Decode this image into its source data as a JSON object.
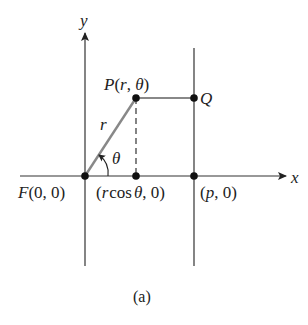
{
  "figure": {
    "caption": "(a)",
    "axes": {
      "x_label": "x",
      "y_label": "y"
    },
    "points": {
      "F": {
        "label_name": "F",
        "label_coords": "(0, 0)"
      },
      "P": {
        "label_name": "P",
        "label_coords": "(r, θ)"
      },
      "Q": {
        "label": "Q"
      },
      "foot": {
        "label_prefix": "(",
        "label_r": "r",
        "label_cos": "cos",
        "label_theta": "θ",
        "label_suffix": ", 0)"
      },
      "directrix_point": {
        "label_open": "(",
        "label_p": "p",
        "label_close": ", 0)"
      }
    },
    "segment_labels": {
      "radius": "r",
      "angle": "θ"
    },
    "colors": {
      "axis": "#333333",
      "radius_line": "#888888",
      "horizontal_segment": "#888888",
      "point": "#111111"
    }
  }
}
